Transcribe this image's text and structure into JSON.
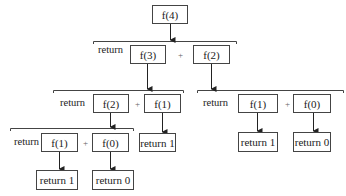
{
  "diagram": {
    "root": {
      "label": "f(4)"
    },
    "return_word": "return",
    "plus": "+",
    "nodes": {
      "f4": "f(4)",
      "f3": "f(3)",
      "f2_top": "f(2)",
      "f2_left": "f(2)",
      "f1_mid": "f(1)",
      "f1_left": "f(1)",
      "f0_left": "f(0)",
      "f1_right": "f(1)",
      "f0_right": "f(0)",
      "ret1_mid": "return 1",
      "ret1_left": "return 1",
      "ret0_left": "return 0",
      "ret1_right": "return 1",
      "ret0_right": "return 0"
    },
    "edges": [
      [
        "f(4)",
        "return f(3) + f(2)"
      ],
      [
        "f(3)",
        "return f(2) + f(1)"
      ],
      [
        "f(2)",
        "return f(1) + f(0)"
      ],
      [
        "f(2)",
        "return f(1) + f(0)"
      ],
      [
        "f(1)",
        "return 1"
      ],
      [
        "f(1)",
        "return 1"
      ],
      [
        "f(0)",
        "return 0"
      ],
      [
        "f(1)",
        "return 1"
      ],
      [
        "f(0)",
        "return 0"
      ]
    ]
  }
}
